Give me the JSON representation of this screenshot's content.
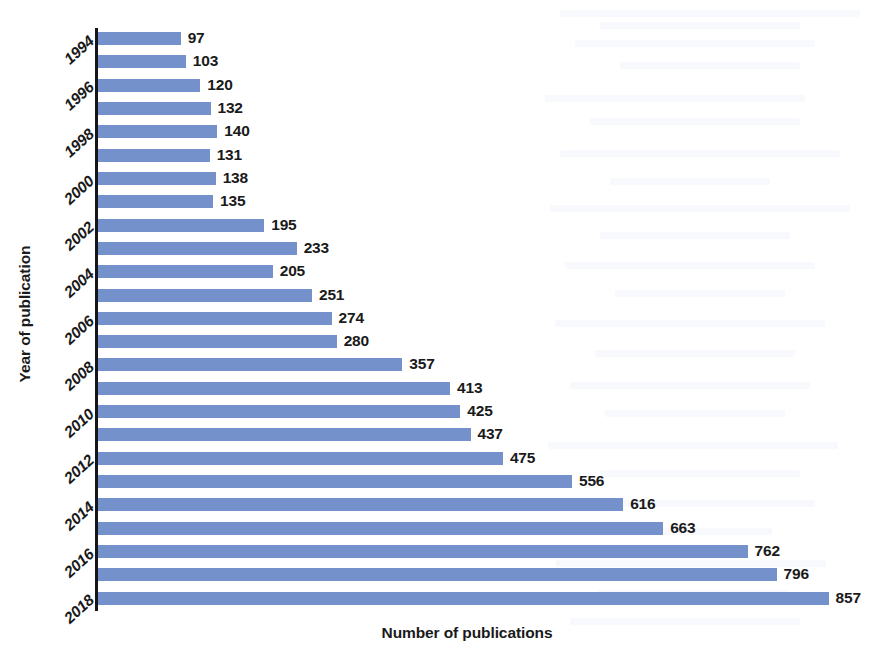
{
  "chart_data": {
    "type": "bar",
    "orientation": "horizontal",
    "title": "",
    "xlabel": "Number of publications",
    "ylabel": "Year of publication",
    "grid": false,
    "legend": null,
    "xlim": [
      0,
      900
    ],
    "bar_color": "#7491cb",
    "axis_color": "#14161c",
    "background_color": "#ffffff",
    "data_labels_shown": true,
    "tick_label_interval": 2,
    "categories": [
      "1994",
      "1995",
      "1996",
      "1997",
      "1998",
      "1999",
      "2000",
      "2001",
      "2002",
      "2003",
      "2004",
      "2005",
      "2006",
      "2007",
      "2008",
      "2009",
      "2010",
      "2011",
      "2012",
      "2013",
      "2014",
      "2015",
      "2016",
      "2017",
      "2018",
      "2019"
    ],
    "visible_tick_labels": [
      "1994",
      "1996",
      "1998",
      "2000",
      "2002",
      "2004",
      "2006",
      "2008",
      "2010",
      "2012",
      "2014",
      "2016",
      "2018"
    ],
    "values": [
      97,
      103,
      120,
      132,
      140,
      131,
      138,
      135,
      195,
      233,
      205,
      251,
      274,
      280,
      357,
      413,
      425,
      437,
      475,
      556,
      616,
      663,
      762,
      796,
      857,
      857
    ],
    "points": [
      {
        "year": "1994",
        "value": 97,
        "label": "97"
      },
      {
        "year": "1995",
        "value": 103,
        "label": "103"
      },
      {
        "year": "1996",
        "value": 120,
        "label": "120"
      },
      {
        "year": "1997",
        "value": 132,
        "label": "132"
      },
      {
        "year": "1998",
        "value": 140,
        "label": "140"
      },
      {
        "year": "1999",
        "value": 131,
        "label": "131"
      },
      {
        "year": "2000",
        "value": 138,
        "label": "138"
      },
      {
        "year": "2001",
        "value": 135,
        "label": "135"
      },
      {
        "year": "2002",
        "value": 195,
        "label": "195"
      },
      {
        "year": "2003",
        "value": 233,
        "label": "233"
      },
      {
        "year": "2004",
        "value": 205,
        "label": "205"
      },
      {
        "year": "2005",
        "value": 251,
        "label": "251"
      },
      {
        "year": "2006",
        "value": 274,
        "label": "274"
      },
      {
        "year": "2007",
        "value": 280,
        "label": "280"
      },
      {
        "year": "2008",
        "value": 357,
        "label": "357"
      },
      {
        "year": "2009",
        "value": 413,
        "label": "413"
      },
      {
        "year": "2010",
        "value": 425,
        "label": "425"
      },
      {
        "year": "2011",
        "value": 437,
        "label": "437"
      },
      {
        "year": "2012",
        "value": 475,
        "label": "475"
      },
      {
        "year": "2013",
        "value": 556,
        "label": "556"
      },
      {
        "year": "2014",
        "value": 616,
        "label": "616"
      },
      {
        "year": "2015",
        "value": 663,
        "label": "663"
      },
      {
        "year": "2016",
        "value": 762,
        "label": "762"
      },
      {
        "year": "2017",
        "value": 796,
        "label": "796"
      },
      {
        "year": "2018",
        "value": 857,
        "label": "857"
      }
    ]
  }
}
